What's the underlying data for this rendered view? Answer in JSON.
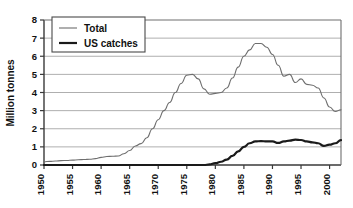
{
  "chart_data": {
    "type": "line",
    "title": "",
    "xlabel": "",
    "ylabel": "Million tonnes",
    "xlim": [
      1950,
      2002
    ],
    "ylim": [
      0,
      8
    ],
    "grid": true,
    "grid_axis": "y",
    "legend_position": "top-left",
    "xticks": [
      "1950",
      "1955",
      "1960",
      "1965",
      "1970",
      "1975",
      "1980",
      "1985",
      "1990",
      "1995",
      "2000"
    ],
    "xtick_values": [
      1950,
      1955,
      1960,
      1965,
      1970,
      1975,
      1980,
      1985,
      1990,
      1995,
      2000
    ],
    "yticks": [
      "0",
      "1",
      "2",
      "3",
      "4",
      "5",
      "6",
      "7",
      "8"
    ],
    "ytick_values": [
      0,
      1,
      2,
      3,
      4,
      5,
      6,
      7,
      8
    ],
    "x": [
      1950,
      1951,
      1952,
      1953,
      1954,
      1955,
      1956,
      1957,
      1958,
      1959,
      1960,
      1961,
      1962,
      1963,
      1964,
      1965,
      1966,
      1967,
      1968,
      1969,
      1970,
      1971,
      1972,
      1973,
      1974,
      1975,
      1976,
      1977,
      1978,
      1979,
      1980,
      1981,
      1982,
      1983,
      1984,
      1985,
      1986,
      1987,
      1988,
      1989,
      1990,
      1991,
      1992,
      1993,
      1994,
      1995,
      1996,
      1997,
      1998,
      1999,
      2000,
      2001,
      2002
    ],
    "series": [
      {
        "name": "Total",
        "color": "#6e6e6e",
        "line_width": 1.1,
        "values": [
          0.18,
          0.2,
          0.22,
          0.24,
          0.25,
          0.27,
          0.29,
          0.3,
          0.32,
          0.35,
          0.42,
          0.47,
          0.48,
          0.5,
          0.62,
          0.8,
          1.05,
          1.18,
          1.5,
          2.0,
          2.5,
          3.0,
          3.45,
          4.0,
          4.5,
          4.95,
          5.0,
          4.75,
          4.2,
          3.9,
          3.95,
          4.0,
          4.25,
          4.8,
          5.4,
          6.0,
          6.35,
          6.7,
          6.7,
          6.5,
          6.1,
          5.5,
          4.9,
          5.0,
          4.55,
          4.75,
          4.45,
          4.4,
          4.25,
          3.7,
          3.2,
          2.95,
          3.05
        ]
      },
      {
        "name": "US catches",
        "color": "#1a1a1a",
        "line_width": 2.2,
        "values": [
          0.0,
          0.0,
          0.0,
          0.0,
          0.0,
          0.0,
          0.0,
          0.0,
          0.0,
          0.0,
          0.0,
          0.0,
          0.0,
          0.0,
          0.0,
          0.0,
          0.0,
          0.0,
          0.0,
          0.0,
          0.0,
          0.0,
          0.0,
          0.0,
          0.0,
          0.0,
          0.0,
          0.0,
          0.0,
          0.03,
          0.1,
          0.18,
          0.3,
          0.5,
          0.75,
          1.0,
          1.2,
          1.3,
          1.32,
          1.3,
          1.3,
          1.22,
          1.3,
          1.35,
          1.4,
          1.38,
          1.3,
          1.25,
          1.2,
          1.05,
          1.12,
          1.2,
          1.37
        ]
      }
    ]
  },
  "legend": {
    "items": [
      {
        "label": "Total"
      },
      {
        "label": "US catches"
      }
    ]
  },
  "axes": {
    "y_title": "Million tonnes"
  }
}
